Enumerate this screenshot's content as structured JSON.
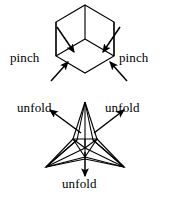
{
  "figure": {
    "background_color": "#ffffff",
    "stroke_color": "#000000",
    "width": 169,
    "height": 197,
    "labels": {
      "pinch_left": "pinch",
      "pinch_right": "pinch",
      "unfold_left": "unfold",
      "unfold_right": "unfold",
      "unfold_bottom": "unfold"
    },
    "top_shape": {
      "name": "hexagon-with-center-spokes",
      "description": "regular hexagon with three spokes from center to alternating vertices",
      "center": [
        85,
        39
      ],
      "vertices": [
        [
          85,
          5
        ],
        [
          114,
          22
        ],
        [
          114,
          56
        ],
        [
          85,
          73
        ],
        [
          56,
          56
        ],
        [
          56,
          22
        ]
      ],
      "spokes_to": [
        [
          85,
          5
        ],
        [
          114,
          56
        ],
        [
          56,
          56
        ]
      ]
    },
    "bottom_shape": {
      "name": "three-pointed-star-pyramid",
      "description": "three pointed star / flattened triangular pyramid wireframe",
      "tips": [
        [
          85,
          102
        ],
        [
          46,
          167
        ],
        [
          124,
          167
        ]
      ],
      "inner": [
        [
          73,
          139
        ],
        [
          97,
          139
        ],
        [
          85,
          158
        ]
      ],
      "apex": [
        85,
        148
      ]
    },
    "arrows": {
      "pinch_left_upper": {
        "from": [
          57,
          28
        ],
        "to": [
          74,
          53
        ]
      },
      "pinch_left_lower": {
        "from": [
          52,
          79
        ],
        "to": [
          69,
          62
        ]
      },
      "pinch_right_upper": {
        "from": [
          120,
          28
        ],
        "to": [
          103,
          53
        ]
      },
      "pinch_right_lower": {
        "from": [
          126,
          79
        ],
        "to": [
          109,
          62
        ]
      },
      "unfold_left": {
        "from": [
          80,
          132
        ],
        "to": [
          50,
          110
        ]
      },
      "unfold_right": {
        "from": [
          95,
          132
        ],
        "to": [
          124,
          110
        ]
      },
      "unfold_bottom": {
        "from": [
          85,
          152
        ],
        "to": [
          85,
          176
        ]
      }
    }
  }
}
